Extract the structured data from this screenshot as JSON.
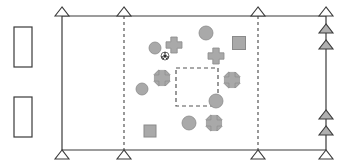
{
  "diagram": {
    "canvas": {
      "width": 350,
      "height": 163,
      "background": "#ffffff"
    },
    "colors": {
      "line": "#3a3a3a",
      "shape_fill": "#a9a9a9",
      "shape_stroke": "#8a8a8a",
      "triangle_fill_open": "#ffffff",
      "triangle_fill_solid": "#b0b0b0",
      "dashed": "#555555",
      "rect_fill": "#ffffff"
    },
    "frame": {
      "top_line": {
        "x1": 62,
        "y1": 16,
        "x2": 326,
        "y2": 16
      },
      "bottom_line": {
        "x1": 62,
        "y1": 150,
        "x2": 326,
        "y2": 150
      },
      "left_line": {
        "x1": 62,
        "y1": 16,
        "x2": 62,
        "y2": 150
      },
      "right_line": {
        "x1": 326,
        "y1": 16,
        "x2": 326,
        "y2": 150
      }
    },
    "dashed_guides": [
      {
        "name": "dashed-guide-left",
        "x": 124,
        "y1": 16,
        "y2": 150
      },
      {
        "name": "dashed-guide-right",
        "x": 258,
        "y1": 16,
        "y2": 150
      }
    ],
    "dashed_box": {
      "name": "dashed-inner-box",
      "x": 176,
      "y": 68,
      "width": 42,
      "height": 38
    },
    "side_rectangles": [
      {
        "name": "side-rectangle-upper",
        "x": 14,
        "y": 27,
        "width": 18,
        "height": 40
      },
      {
        "name": "side-rectangle-lower",
        "x": 14,
        "y": 97,
        "width": 18,
        "height": 40
      }
    ],
    "triangles_top": [
      {
        "name": "triangle-top-left",
        "x": 62,
        "y": 16,
        "filled": false
      },
      {
        "name": "triangle-top-mid",
        "x": 124,
        "y": 16,
        "filled": false
      },
      {
        "name": "triangle-top-right-inner",
        "x": 258,
        "y": 16,
        "filled": false
      },
      {
        "name": "triangle-top-right-corner",
        "x": 326,
        "y": 16,
        "filled": false
      }
    ],
    "triangles_bottom": [
      {
        "name": "triangle-bottom-left",
        "x": 62,
        "y": 150,
        "filled": false
      },
      {
        "name": "triangle-bottom-mid",
        "x": 124,
        "y": 150,
        "filled": false
      },
      {
        "name": "triangle-bottom-right-inner",
        "x": 258,
        "y": 150,
        "filled": false
      },
      {
        "name": "triangle-bottom-right-corner",
        "x": 326,
        "y": 150,
        "filled": false
      }
    ],
    "triangles_right_edge": [
      {
        "name": "triangle-right-1",
        "x": 326,
        "y": 33,
        "filled": true
      },
      {
        "name": "triangle-right-2",
        "x": 326,
        "y": 49,
        "filled": true
      },
      {
        "name": "triangle-right-3",
        "x": 326,
        "y": 119,
        "filled": true
      },
      {
        "name": "triangle-right-4",
        "x": 326,
        "y": 135,
        "filled": true
      }
    ],
    "scatter_shapes": [
      {
        "name": "circle-1",
        "type": "circle",
        "cx": 155,
        "cy": 48,
        "r": 6
      },
      {
        "name": "soccer-ball-1",
        "type": "soccer-ball",
        "cx": 165,
        "cy": 56,
        "r": 4
      },
      {
        "name": "cross-1",
        "type": "cross",
        "cx": 174,
        "cy": 45,
        "r": 8
      },
      {
        "name": "circle-2",
        "type": "circle",
        "cx": 206,
        "cy": 33,
        "r": 7
      },
      {
        "name": "square-1",
        "type": "square",
        "cx": 239,
        "cy": 43,
        "s": 13
      },
      {
        "name": "cross-2",
        "type": "cross",
        "cx": 216,
        "cy": 56,
        "r": 8
      },
      {
        "name": "flower-1",
        "type": "flower",
        "cx": 162,
        "cy": 78,
        "r": 8
      },
      {
        "name": "flower-2",
        "type": "flower",
        "cx": 232,
        "cy": 80,
        "r": 8
      },
      {
        "name": "circle-3",
        "type": "circle",
        "cx": 142,
        "cy": 89,
        "r": 6
      },
      {
        "name": "circle-4",
        "type": "circle",
        "cx": 216,
        "cy": 101,
        "r": 7
      },
      {
        "name": "circle-5",
        "type": "circle",
        "cx": 189,
        "cy": 123,
        "r": 7
      },
      {
        "name": "flower-3",
        "type": "flower",
        "cx": 214,
        "cy": 123,
        "r": 8
      },
      {
        "name": "square-2",
        "type": "square",
        "cx": 150,
        "cy": 131,
        "s": 12
      }
    ]
  }
}
